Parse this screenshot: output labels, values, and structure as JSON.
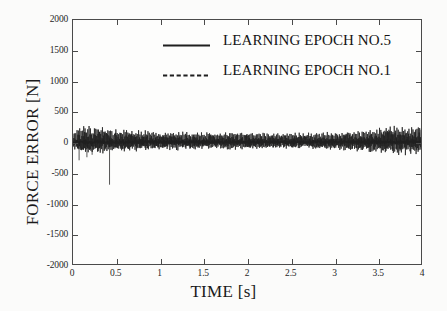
{
  "chart_data": {
    "type": "line",
    "title": "",
    "subtitle": "",
    "xlabel": "TIME [s]",
    "ylabel": "FORCE ERROR [N]",
    "xlim": [
      0,
      4
    ],
    "ylim": [
      -2000,
      2000
    ],
    "xticks": [
      "0",
      "0.5",
      "1",
      "1.5",
      "2",
      "2.5",
      "3",
      "3.5",
      "4"
    ],
    "xtick_values": [
      0,
      0.5,
      1,
      1.5,
      2,
      2.5,
      3,
      3.5,
      4
    ],
    "yticks": [
      "2000",
      "1500",
      "1000",
      "500",
      "0",
      "-500",
      "-1000",
      "-1500",
      "-2000"
    ],
    "ytick_values": [
      2000,
      1500,
      1000,
      500,
      0,
      -500,
      -1000,
      -1500,
      -2000
    ],
    "grid": false,
    "legend_position": "top-center",
    "line_color": "#1f1f1f",
    "frame_color": "#4a4a4a",
    "background_color": "#fbfbfa",
    "series": [
      {
        "name": "LEARNING EPOCH NO.5",
        "style": "solid",
        "description": "Converged force error, essentially flat at 0 N across the whole 0-4 s window, residual ripple within about +/-25 N.",
        "mean": 0,
        "amplitude": 25,
        "x_range": [
          0,
          4
        ]
      },
      {
        "name": "LEARNING EPOCH NO.1",
        "style": "dashed",
        "description": "High-frequency oscillating force error about 0 N. Envelope near +/-230 N for t<0.3 s, settling to roughly +/-120 N through the mid window, then growing back to about +/-220 N as t approaches 4 s. A single large negative transient reaches about -700 N at t = 0.42 s.",
        "mean": 0,
        "envelope_points": [
          {
            "t": 0.0,
            "amp": 120
          },
          {
            "t": 0.1,
            "amp": 235
          },
          {
            "t": 0.25,
            "amp": 215
          },
          {
            "t": 0.5,
            "amp": 175
          },
          {
            "t": 1.0,
            "amp": 140
          },
          {
            "t": 1.5,
            "amp": 130
          },
          {
            "t": 2.0,
            "amp": 135
          },
          {
            "t": 2.5,
            "amp": 120
          },
          {
            "t": 3.0,
            "amp": 130
          },
          {
            "t": 3.4,
            "amp": 170
          },
          {
            "t": 3.7,
            "amp": 215
          },
          {
            "t": 4.0,
            "amp": 225
          }
        ],
        "spike": {
          "t": 0.42,
          "value": -700,
          "label": "large negative transient"
        },
        "early_negative_dips": [
          {
            "t": 0.07,
            "value": -300
          },
          {
            "t": 0.16,
            "value": -250
          },
          {
            "t": 0.22,
            "value": -210
          }
        ]
      }
    ]
  },
  "legend": {
    "items": [
      {
        "label": "LEARNING EPOCH NO.5",
        "style": "solid"
      },
      {
        "label": "LEARNING EPOCH NO.1",
        "style": "dashed"
      }
    ]
  },
  "axes": {
    "y_title": "FORCE ERROR [N]",
    "x_title": "TIME [s]",
    "y_ticks": [
      "2000",
      "1500",
      "1000",
      "500",
      "0",
      "-500",
      "-1000",
      "-1500",
      "-2000"
    ],
    "x_ticks": [
      "0",
      "0.5",
      "1",
      "1.5",
      "2",
      "2.5",
      "3",
      "3.5",
      "4"
    ]
  }
}
